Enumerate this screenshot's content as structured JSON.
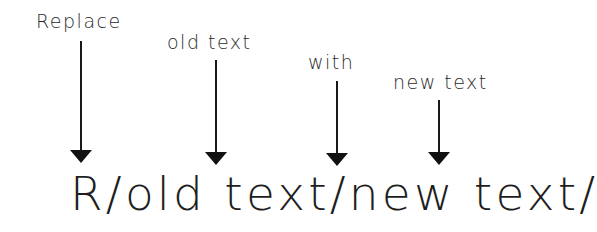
{
  "diagram": {
    "labels": [
      {
        "text": "Replace",
        "x": 36,
        "y": 12
      },
      {
        "text": "old text",
        "x": 167,
        "y": 33
      },
      {
        "text": "with",
        "x": 308,
        "y": 53
      },
      {
        "text": "new text",
        "x": 393,
        "y": 73
      }
    ],
    "arrows": [
      {
        "target": "R",
        "x": 81,
        "top": 41,
        "bottom": 163
      },
      {
        "target": "old text",
        "x": 216,
        "top": 60,
        "bottom": 165
      },
      {
        "target": "new (with delimiter)",
        "x": 337,
        "top": 81,
        "bottom": 166
      },
      {
        "target": "new text",
        "x": 439,
        "top": 100,
        "bottom": 165
      }
    ],
    "command": "R/old text/new text/",
    "colors": {
      "background": "#ffffff",
      "ink": "#1a1a1a"
    }
  }
}
